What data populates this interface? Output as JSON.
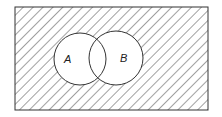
{
  "diagram": {
    "type": "venn",
    "universe": {
      "x": 15,
      "y": 7,
      "width": 193,
      "height": 103,
      "shaded": true
    },
    "sets": [
      {
        "label": "A",
        "cx": 80,
        "cy": 59,
        "r": 26,
        "label_x": 68,
        "label_y": 63
      },
      {
        "label": "B",
        "cx": 116,
        "cy": 58,
        "r": 27,
        "label_x": 121,
        "label_y": 62
      }
    ],
    "colors": {
      "stroke": "#333333",
      "hatch": "#444444",
      "background": "#ffffff"
    }
  }
}
